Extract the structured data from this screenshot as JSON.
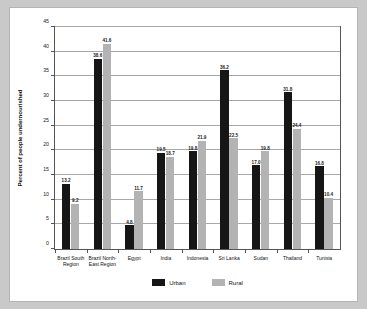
{
  "chart_data": {
    "type": "bar",
    "title": "",
    "xlabel": "",
    "ylabel": "Percent of people undernourished",
    "ylim": [
      0,
      45
    ],
    "ytick_step": 5,
    "yticks": [
      "0",
      "5",
      "10",
      "15",
      "20",
      "25",
      "30",
      "35",
      "40",
      "45"
    ],
    "grid": true,
    "legend_position": "bottom",
    "categories": [
      "Brazil South Region",
      "Brazil North-East Region",
      "Egypt",
      "India",
      "Indonesia",
      "Sri Lanka",
      "Sudan",
      "Thailand",
      "Tunisia"
    ],
    "category_lines": [
      [
        "Brazil South",
        "Region"
      ],
      [
        "Brazil North-",
        "East Region"
      ],
      [
        "Egypt"
      ],
      [
        "India"
      ],
      [
        "Indonesia"
      ],
      [
        "Sri Lanka"
      ],
      [
        "Sudan"
      ],
      [
        "Thailand"
      ],
      [
        "Tunisia"
      ]
    ],
    "series": [
      {
        "name": "Urban",
        "color": "#161616",
        "values": [
          13.2,
          38.6,
          4.8,
          19.5,
          19.8,
          36.2,
          17.0,
          31.8,
          16.8
        ]
      },
      {
        "name": "Rural",
        "color": "#b3b3b3",
        "values": [
          9.2,
          41.6,
          11.7,
          18.7,
          21.9,
          22.5,
          19.8,
          24.4,
          10.4
        ]
      }
    ]
  },
  "legend": {
    "items": [
      {
        "label": "Urban",
        "color": "#161616"
      },
      {
        "label": "Rural",
        "color": "#b3b3b3"
      }
    ]
  },
  "colors": {
    "figure_background": "#ffffff",
    "page_background": "#c9c9c9",
    "axis": "#555555",
    "gridline": "#a8a8a8",
    "text": "#111111"
  }
}
